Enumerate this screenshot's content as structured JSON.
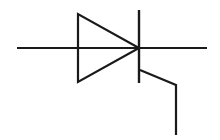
{
  "diagram": {
    "title": "Thyristor (SCR) schematic symbol",
    "symbol": "thyristor",
    "stroke_color": "#1a1a1a",
    "background_color": "#ffffff",
    "elements": {
      "anode_lead": {
        "x1": 17,
        "y1": 48,
        "x2": 139,
        "y2": 48
      },
      "triangle": {
        "points": "78,14 78,82 139,48"
      },
      "cathode_bar": {
        "x1": 139,
        "y1": 10,
        "x2": 139,
        "y2": 83
      },
      "cathode_lead": {
        "x1": 139,
        "y1": 48,
        "x2": 207,
        "y2": 48
      },
      "gate_lead": {
        "points": "140,70 176,85 176,135"
      }
    }
  }
}
